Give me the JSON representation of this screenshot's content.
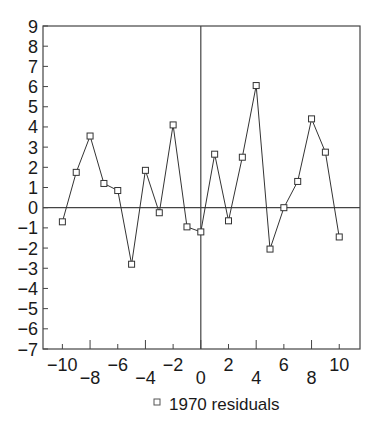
{
  "chart_data": {
    "type": "line",
    "title": "",
    "xlabel": "",
    "ylabel": "",
    "xlim": [
      -11.4,
      11.5
    ],
    "ylim": [
      -7,
      9
    ],
    "grid": false,
    "zero_lines": true,
    "legend_position": "bottom",
    "x_ticks": [
      -10,
      -8,
      -6,
      -4,
      -2,
      0,
      2,
      4,
      6,
      8,
      10
    ],
    "x_tick_labels": [
      "−10",
      "−8",
      "−6",
      "−4",
      "−2",
      "0",
      "2",
      "4",
      "6",
      "8",
      "10"
    ],
    "y_ticks": [
      9,
      8,
      7,
      6,
      5,
      4,
      3,
      2,
      1,
      0,
      -1,
      -2,
      -3,
      -4,
      -5,
      -6,
      -7
    ],
    "y_tick_labels": [
      "9",
      "8",
      "7",
      "6",
      "5",
      "4",
      "3",
      "2",
      "1",
      "0",
      "−1",
      "−2",
      "−3",
      "−4",
      "−5",
      "−6",
      "−7"
    ],
    "series": [
      {
        "name": "1970 residuals",
        "marker": "square",
        "x": [
          -10,
          -9,
          -8,
          -7,
          -6,
          -5,
          -4,
          -3,
          -2,
          -1,
          0,
          1,
          2,
          3,
          4,
          5,
          6,
          7,
          8,
          9,
          10
        ],
        "values": [
          -0.7,
          1.75,
          3.55,
          1.2,
          0.85,
          -2.8,
          1.85,
          -0.25,
          4.1,
          -0.95,
          -1.2,
          2.65,
          -0.65,
          2.5,
          6.05,
          -2.05,
          0.0,
          1.3,
          4.4,
          2.75,
          -1.45
        ]
      }
    ]
  },
  "legend": {
    "label": "1970 residuals",
    "marker": "square"
  },
  "colors": {
    "line": "#333333",
    "axis": "#444444",
    "background": "#ffffff",
    "text": "#1a1a1a"
  }
}
